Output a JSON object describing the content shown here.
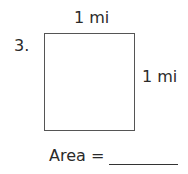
{
  "problem": {
    "number": "3.",
    "top_side_label": "1 mi",
    "right_side_label": "1 mi",
    "area_label": "Area =",
    "answer_value": ""
  },
  "shape": {
    "type": "square",
    "stroke_color": "#555555"
  }
}
